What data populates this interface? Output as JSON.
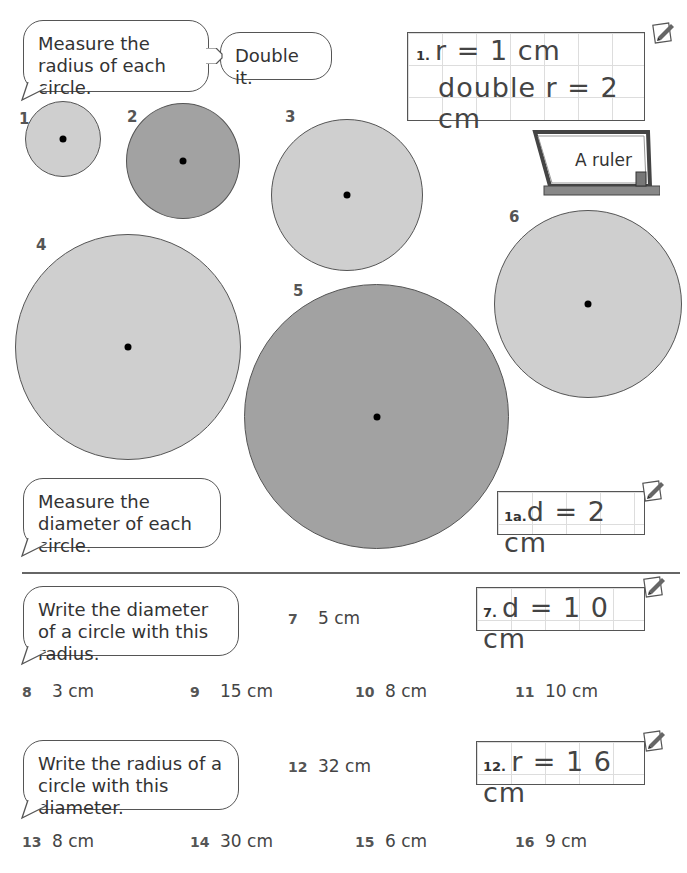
{
  "section_a": {
    "instruction_radius": "Measure the radius of each circle.",
    "instruction_double": "Double it.",
    "example": {
      "label": "1.",
      "line1": "r = 1 cm",
      "line2": "double  r = 2 cm"
    },
    "tip": "A ruler",
    "circles": [
      {
        "number": "1",
        "shade": "light"
      },
      {
        "number": "2",
        "shade": "dark"
      },
      {
        "number": "3",
        "shade": "light"
      },
      {
        "number": "4",
        "shade": "light"
      },
      {
        "number": "5",
        "shade": "dark"
      },
      {
        "number": "6",
        "shade": "light"
      }
    ],
    "instruction_diameter": "Measure the diameter of each circle.",
    "example_diameter": {
      "label": "1a.",
      "answer": "d = 2 cm"
    }
  },
  "section_b": {
    "instruction": "Write the diameter of a circle with this radius.",
    "example": {
      "label": "7.",
      "answer": "d = 1 0 cm"
    },
    "questions": [
      {
        "number": "7",
        "value": "5 cm"
      },
      {
        "number": "8",
        "value": "3 cm"
      },
      {
        "number": "9",
        "value": "15 cm"
      },
      {
        "number": "10",
        "value": "8 cm"
      },
      {
        "number": "11",
        "value": "10 cm"
      }
    ]
  },
  "section_c": {
    "instruction": "Write the radius of a circle with this diameter.",
    "example": {
      "label": "12.",
      "answer": "r = 1 6 cm"
    },
    "questions": [
      {
        "number": "12",
        "value": "32 cm"
      },
      {
        "number": "13",
        "value": "8 cm"
      },
      {
        "number": "14",
        "value": "30 cm"
      },
      {
        "number": "15",
        "value": "6 cm"
      },
      {
        "number": "16",
        "value": "9 cm"
      }
    ]
  }
}
